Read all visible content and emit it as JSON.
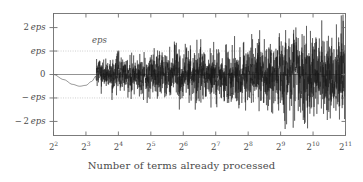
{
  "chart_data": {
    "type": "line",
    "title": "",
    "xlabel": "Number of terms already processed",
    "ylabel": "",
    "annotation": "eps",
    "grid": "horizontal-dotted-at-plus-eps-and-minus-eps",
    "zero_line": true,
    "legend": "none",
    "x_scale": "log2",
    "xlim": [
      4,
      2048
    ],
    "ylim": [
      -2.6,
      2.6
    ],
    "x_tick_labels": [
      "2²",
      "2³",
      "2⁴",
      "2⁵",
      "2⁶",
      "2⁷",
      "2⁸",
      "2⁹",
      "2¹⁰",
      "2¹¹"
    ],
    "x_tick_bases": [
      "2",
      "2",
      "2",
      "2",
      "2",
      "2",
      "2",
      "2",
      "2",
      "2"
    ],
    "x_tick_exponents": [
      "2",
      "3",
      "4",
      "5",
      "6",
      "7",
      "8",
      "9",
      "10",
      "11"
    ],
    "x_tick_values": [
      4,
      8,
      16,
      32,
      64,
      128,
      256,
      512,
      1024,
      2048
    ],
    "y_tick_labels": [
      "2 eps",
      "eps",
      "0",
      "− eps",
      "− 2 eps"
    ],
    "y_tick_values": [
      2,
      1,
      0,
      -1,
      -2
    ],
    "series": [
      {
        "name": "rounding error",
        "units": "eps",
        "description": "Accumulated floating point summation error growing like a random walk as the number of terms increases",
        "envelope_note": "Amplitude grows from about 0.5 eps near 2^2 to about 2.5 eps near 2^11",
        "x": [
          4,
          5,
          6,
          7,
          8,
          9,
          10,
          12,
          14,
          16,
          20,
          24,
          28,
          32,
          40,
          48,
          56,
          64,
          80,
          96,
          112,
          128,
          160,
          192,
          224,
          256,
          320,
          384,
          448,
          512,
          640,
          768,
          896,
          1024,
          1280,
          1536,
          1792,
          2048
        ],
        "y": [
          0.0,
          -0.22,
          -0.42,
          -0.5,
          -0.46,
          -0.3,
          -0.05,
          0.32,
          0.5,
          0.18,
          -0.55,
          -0.34,
          -0.62,
          -0.28,
          0.55,
          -0.4,
          0.75,
          -0.5,
          0.95,
          -0.8,
          0.6,
          -1.05,
          1.2,
          -0.95,
          0.85,
          -1.3,
          1.45,
          -1.2,
          1.6,
          -1.85,
          1.55,
          -1.7,
          1.9,
          -2.1,
          1.8,
          -2.0,
          2.3,
          -2.2
        ],
        "color": "#1a1a1a"
      }
    ],
    "colors": {
      "line": "#1a1a1a",
      "zero_line": "#888888",
      "grid_dotted": "#aaaaaa",
      "frame": "#6e6e6e",
      "text": "#4a4a4a",
      "background": "#ffffff"
    },
    "seed": 20240517,
    "noise_model": {
      "type": "random-walk-normalized",
      "start_index": 8,
      "growth": "amplitude proportional to sqrt(log2(n))"
    }
  }
}
